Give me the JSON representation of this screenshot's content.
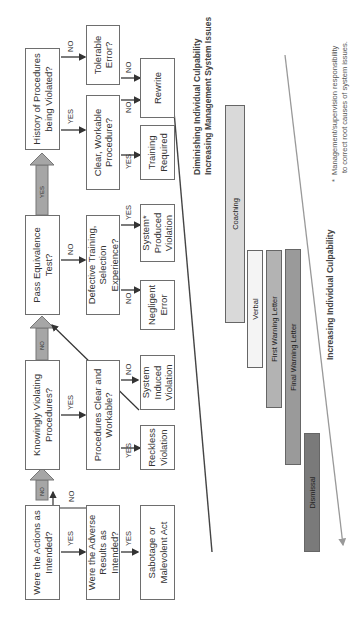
{
  "flowchart": {
    "decisions": {
      "actions_intended": "Were the Actions as Intended?",
      "adverse_results": "Were the Adverse Results as Intended?",
      "knowingly_violating": "Knowingly Violating Procedures?",
      "procedures_clear": "Procedures Clear and Workable?",
      "pass_equivalence": "Pass Equivalence Test?",
      "defective_training": "Defective Training, Selection Experience?",
      "history_violated": "History of Procedures being Violated?",
      "clear_workable": "Clear, Workable Procedure?",
      "tolerable_error": "Tolerable Error?"
    },
    "outcomes": {
      "sabotage": "Sabotage or Malevolent Act",
      "reckless": "Reckless Violation",
      "system_induced": "System Induced Violation",
      "negligent": "Negligent Error",
      "system_produced": "System* Produced Violation",
      "training_required": "Training Required",
      "rewrite": "Rewrite"
    },
    "edge_labels": {
      "yes": "YES",
      "no": "NO"
    }
  },
  "discipline_scale": {
    "bars": [
      {
        "label": "Coaching",
        "color": "#d9d9d9"
      },
      {
        "label": "Verbal",
        "color": "#f4f4f4"
      },
      {
        "label": "First Warning Letter",
        "color": "#b3b3b3"
      },
      {
        "label": "Final Warning Letter",
        "color": "#9a9a9a"
      },
      {
        "label": "Dismissal",
        "color": "#7a7a7a"
      }
    ],
    "upper_axis": {
      "line1": "Diminishing Individual Culpability",
      "line2": "Increasing Management System Issues"
    },
    "lower_axis": "Increasing Individual Culpability"
  },
  "footnote": {
    "marker": "*",
    "line1": "Management/supervision responsibility",
    "line2": "to correct root causes of system issues."
  }
}
